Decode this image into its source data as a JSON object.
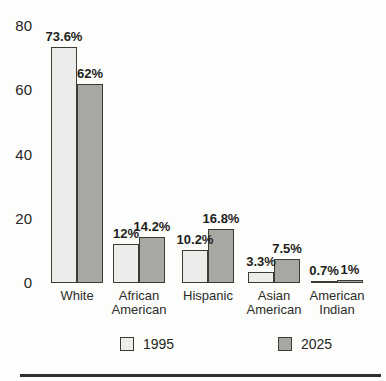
{
  "figure": {
    "background_color": "#fdfdfb",
    "rule_color": "#2f2f2d"
  },
  "chart_data": {
    "type": "bar",
    "title": "",
    "xlabel": "",
    "ylabel": "",
    "categories": [
      "White",
      "African American",
      "Hispanic",
      "Asian American",
      "American Indian"
    ],
    "series": [
      {
        "name": "1995",
        "values": [
          73.6,
          12,
          10.2,
          3.3,
          0.7
        ],
        "value_labels": [
          "73.6%",
          "12%",
          "10.2%",
          "3.3%",
          "0.7%"
        ],
        "color": "#ececе8"
      },
      {
        "name": "2025",
        "values": [
          62,
          14.2,
          16.8,
          7.5,
          1
        ],
        "value_labels": [
          "62%",
          "14.2%",
          "16.8%",
          "7.5%",
          "1%"
        ],
        "color": "#a9a7a1"
      }
    ],
    "series_colors": [
      "#ececea",
      "#a9a7a1"
    ],
    "bar_border_color": "#3b3b38",
    "y_ticks": [
      0,
      20,
      40,
      60,
      80
    ],
    "ylim": [
      0,
      80
    ],
    "value_suffix": "%",
    "grid": false,
    "legend_position": "bottom",
    "legend_labels": [
      "1995",
      "2025"
    ]
  }
}
